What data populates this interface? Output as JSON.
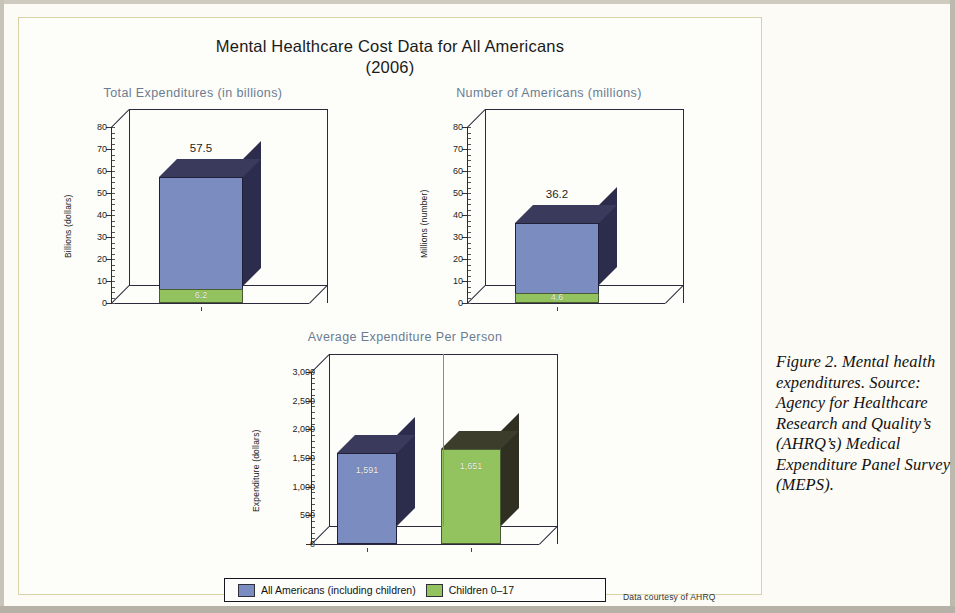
{
  "figure": {
    "main_title_line1": "Mental Healthcare Cost Data for All Americans",
    "main_title_line2": "(2006)",
    "source_note": "Data courtesy of AHRQ",
    "caption": "Figure 2.   Mental health expenditures. Source: Agency for Healthcare Research and Quality’s (AHRQ’s) Medical Expenditure Panel Survey (MEPS)."
  },
  "legend": {
    "items": [
      {
        "label": "All Americans (including children)",
        "color": "#7a8cc0"
      },
      {
        "label": "Children 0–17",
        "color": "#92c35e"
      }
    ]
  },
  "colors": {
    "blue_front": "#7a8cc0",
    "blue_side": "#2c2c4c",
    "blue_top": "#3a3a5c",
    "green_front": "#92c35e",
    "green_side": "#2f2f22",
    "green_top": "#3d3d2c",
    "title_color": "#6b7c92",
    "border": "#d8d2a8"
  },
  "chart_data": [
    {
      "type": "bar",
      "title": "Total Expenditures (in billions)",
      "ylabel": "Billions (dollars)",
      "xlabel": "",
      "ylim": [
        0,
        80
      ],
      "yticks": [
        "0",
        "10",
        "20",
        "30",
        "40",
        "50",
        "60",
        "70",
        "80"
      ],
      "ytick_values": [
        0,
        10,
        20,
        30,
        40,
        50,
        60,
        70,
        80
      ],
      "grid": false,
      "legend_position": "bottom-shared",
      "series": [
        {
          "name": "All Americans (including children)",
          "value": 57.5,
          "label": "57.5"
        },
        {
          "name": "Children 0–17",
          "value": 6.2,
          "label": "6.2"
        }
      ]
    },
    {
      "type": "bar",
      "title": "Number of Americans (millions)",
      "ylabel": "Millions (number)",
      "xlabel": "",
      "ylim": [
        0,
        80
      ],
      "yticks": [
        "0",
        "10",
        "20",
        "30",
        "40",
        "50",
        "60",
        "70",
        "80"
      ],
      "ytick_values": [
        0,
        10,
        20,
        30,
        40,
        50,
        60,
        70,
        80
      ],
      "grid": false,
      "legend_position": "bottom-shared",
      "series": [
        {
          "name": "All Americans (including children)",
          "value": 36.2,
          "label": "36.2"
        },
        {
          "name": "Children 0–17",
          "value": 4.6,
          "label": "4.6"
        }
      ]
    },
    {
      "type": "bar",
      "title": "Average Expenditure Per Person",
      "ylabel": "Expenditure (dollars)",
      "xlabel": "",
      "ylim": [
        0,
        3000
      ],
      "yticks": [
        "0",
        "500",
        "1,000",
        "1,500",
        "2,000",
        "2,500",
        "3,000"
      ],
      "ytick_values": [
        0,
        500,
        1000,
        1500,
        2000,
        2500,
        3000
      ],
      "grid": false,
      "legend_position": "bottom-shared",
      "categories": [
        "All Americans (including children)",
        "Children 0–17"
      ],
      "values": [
        1591,
        1651
      ],
      "value_labels": [
        "1,591",
        "1,651"
      ]
    }
  ]
}
